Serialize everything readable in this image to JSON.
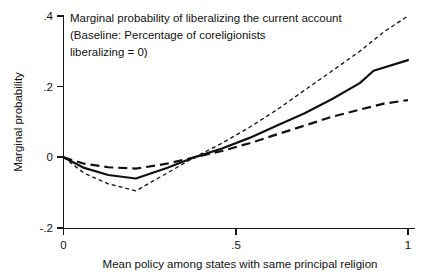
{
  "chart_data": {
    "type": "line",
    "title": "Marginal probability of liberalizing the current account (Baseline: Percentage of coreligionists liberalizing = 0)",
    "title_lines": [
      "Marginal probability of liberalizing the current account",
      "(Baseline: Percentage of coreligionists",
      "liberalizing = 0)"
    ],
    "xlabel": "Mean policy among states with same principal religion",
    "ylabel": "Marginal probability",
    "xlim": [
      0,
      1
    ],
    "ylim": [
      -0.2,
      0.4
    ],
    "xticks": [
      0,
      0.5,
      1
    ],
    "xticklabels": [
      "0",
      ".5",
      "1"
    ],
    "yticks": [
      -0.2,
      0,
      0.2,
      0.4
    ],
    "yticklabels": [
      "-.2",
      "0",
      ".2",
      ".4"
    ],
    "grid": false,
    "legend": "none",
    "series": [
      {
        "name": "Upper confidence bound",
        "style": "fine-dotted",
        "x": [
          0,
          0.06,
          0.13,
          0.21,
          0.3,
          0.38,
          0.46,
          0.54,
          0.62,
          0.7,
          0.78,
          0.86,
          0.93,
          1.0
        ],
        "values": [
          0.0,
          -0.045,
          -0.075,
          -0.095,
          -0.045,
          0.0,
          0.04,
          0.085,
          0.135,
          0.19,
          0.245,
          0.3,
          0.355,
          0.4
        ]
      },
      {
        "name": "Point estimate",
        "style": "solid",
        "x": [
          0,
          0.06,
          0.13,
          0.21,
          0.3,
          0.38,
          0.46,
          0.54,
          0.62,
          0.7,
          0.78,
          0.86,
          0.9,
          1.0
        ],
        "values": [
          0.0,
          -0.03,
          -0.05,
          -0.06,
          -0.03,
          0.0,
          0.025,
          0.055,
          0.09,
          0.125,
          0.165,
          0.21,
          0.245,
          0.275
        ]
      },
      {
        "name": "Lower confidence bound",
        "style": "long-dashed",
        "x": [
          0,
          0.06,
          0.13,
          0.21,
          0.3,
          0.38,
          0.46,
          0.54,
          0.62,
          0.7,
          0.78,
          0.86,
          0.93,
          1.0
        ],
        "values": [
          0.0,
          -0.018,
          -0.028,
          -0.032,
          -0.018,
          0.0,
          0.018,
          0.04,
          0.065,
          0.09,
          0.115,
          0.135,
          0.152,
          0.162
        ]
      }
    ]
  }
}
